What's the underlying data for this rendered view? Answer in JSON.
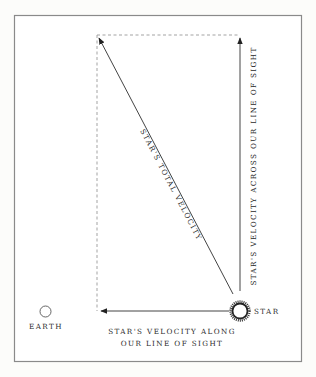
{
  "diagram": {
    "labels": {
      "earth": "EARTH",
      "star": "STAR",
      "total_velocity": "STAR'S TOTAL VELOCITY",
      "across_velocity": "STAR'S VELOCITY ACROSS OUR LINE OF SIGHT",
      "along_velocity_line1": "STAR'S VELOCITY ALONG",
      "along_velocity_line2": "OUR LINE OF SIGHT"
    },
    "colors": {
      "frame": "#8a8a8a",
      "line": "#444444",
      "dashed": "#999999",
      "text": "#2a2a2a"
    }
  }
}
